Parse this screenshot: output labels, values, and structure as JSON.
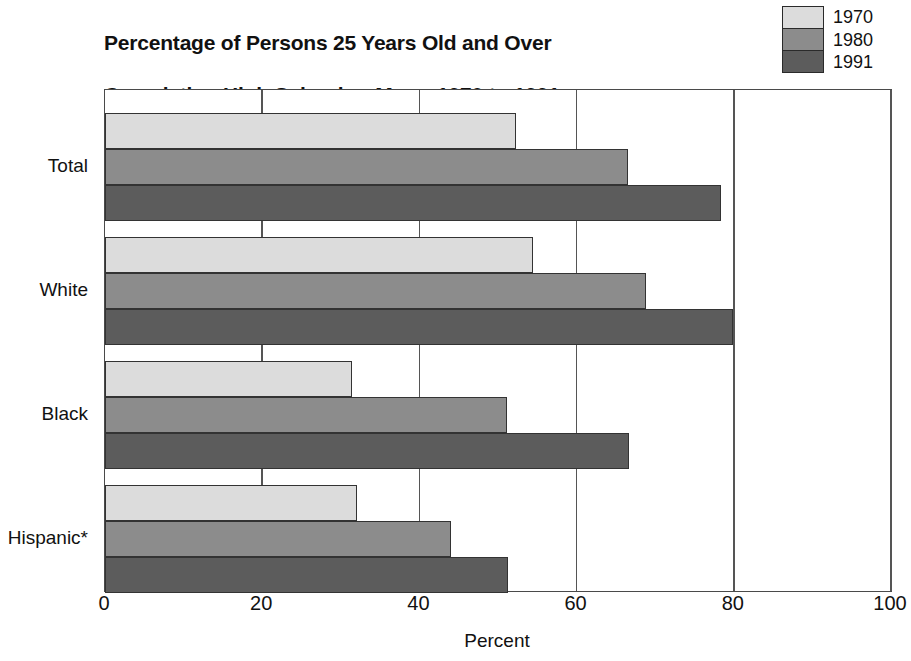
{
  "chart_data": {
    "type": "bar",
    "orientation": "horizontal",
    "title": "Percentage of Persons 25 Years Old and Over\nCompleting High School or More:  1970 to 1991",
    "title_line1": "Percentage of Persons 25 Years Old and Over",
    "title_line2": "Completing High School or More:  1970 to 1991",
    "xlabel": "Percent",
    "ylabel": "",
    "xlim": [
      0,
      100
    ],
    "xticks": [
      0,
      20,
      40,
      60,
      80,
      100
    ],
    "xtick_labels": [
      "0",
      "20",
      "40",
      "60",
      "80",
      "100"
    ],
    "grid": "vertical",
    "legend_position": "top-right",
    "categories": [
      "Total",
      "White",
      "Black",
      "Hispanic*"
    ],
    "series": [
      {
        "name": "1970",
        "color": "#dcdcdc",
        "values": [
          52.3,
          54.5,
          31.4,
          32.1
        ]
      },
      {
        "name": "1980",
        "color": "#8c8c8c",
        "values": [
          66.5,
          68.8,
          51.2,
          44.0
        ]
      },
      {
        "name": "1991",
        "color": "#5c5c5c",
        "values": [
          78.4,
          79.9,
          66.7,
          51.3
        ]
      }
    ],
    "footnote_marker": "*"
  },
  "legend": {
    "entries": [
      {
        "label": "1970",
        "color": "#dcdcdc"
      },
      {
        "label": "1980",
        "color": "#8c8c8c"
      },
      {
        "label": "1991",
        "color": "#5c5c5c"
      }
    ]
  },
  "axis": {
    "x_title": "Percent",
    "tick_labels": [
      "0",
      "20",
      "40",
      "60",
      "80",
      "100"
    ]
  },
  "colors": {
    "series_1970": "#dcdcdc",
    "series_1980": "#8c8c8c",
    "series_1991": "#5c5c5c",
    "axis": "#4a4a4a",
    "text": "#111111",
    "background": "#ffffff"
  }
}
